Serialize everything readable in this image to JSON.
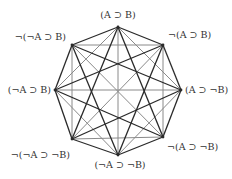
{
  "diagram": {
    "type": "complete-graph-octagon",
    "colors": {
      "dark_edge": "#2a2a2a",
      "gray_edge": "#8a8a8a",
      "label": "#333333",
      "background": "#ffffff"
    },
    "nodes": [
      {
        "id": "top",
        "label": "(A ⊃ B)",
        "x": 118,
        "y": 27
      },
      {
        "id": "upper-right",
        "label": "¬(A ⊃ B)",
        "x": 163,
        "y": 45
      },
      {
        "id": "right",
        "label": "(A ⊃ ¬B)",
        "x": 181,
        "y": 90
      },
      {
        "id": "lower-right",
        "label": "¬(A ⊃ ¬B)",
        "x": 163,
        "y": 137
      },
      {
        "id": "bottom",
        "label": "(¬A ⊃ ¬B)",
        "x": 118,
        "y": 155
      },
      {
        "id": "lower-left",
        "label": "¬(¬A ⊃ ¬B)",
        "x": 72,
        "y": 139
      },
      {
        "id": "left",
        "label": "(¬A ⊃ B)",
        "x": 55,
        "y": 90
      },
      {
        "id": "upper-left",
        "label": "¬(¬A ⊃ B)",
        "x": 72,
        "y": 45
      }
    ],
    "edge_style_rule": "octagon sides and skip-3 chords dark; skip-2 chords and diameters gray"
  }
}
